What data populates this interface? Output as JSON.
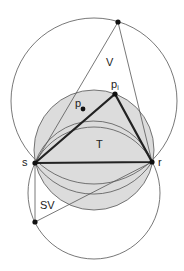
{
  "figure": {
    "labels": {
      "V": "V",
      "T": "T",
      "SV": "SV",
      "s": "s",
      "r": "r",
      "p": "p",
      "p_i": "p",
      "p_i_sub": "i"
    },
    "colors": {
      "shaded_disk": "#dcdcdc",
      "line": "#555555",
      "thick_line": "#222222",
      "point": "#111111"
    },
    "points": {
      "top": [
        118,
        22
      ],
      "s": [
        35,
        163
      ],
      "r": [
        152,
        162
      ],
      "p_i": [
        115,
        94
      ],
      "p": [
        83,
        109
      ],
      "bottom": [
        35,
        222
      ]
    }
  }
}
